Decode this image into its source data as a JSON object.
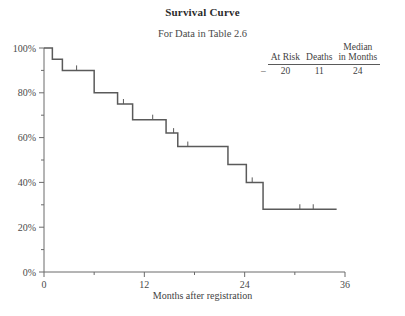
{
  "title": "Survival Curve",
  "subtitle": "For Data in Table 2.6",
  "summary": {
    "marker": "–",
    "headers": [
      "At Risk",
      "Deaths",
      "Median in Months"
    ],
    "header_at_risk": "At Risk",
    "header_deaths": "Deaths",
    "header_median_line1": "Median",
    "header_median_line2": "in Months",
    "values": [
      "20",
      "11",
      "24"
    ],
    "value_at_risk": "20",
    "value_deaths": "11",
    "value_median": "24"
  },
  "chart_data": {
    "type": "line",
    "title": "Survival Curve",
    "subtitle": "For Data in Table 2.6",
    "xlabel": "Months after registration",
    "ylabel": "",
    "xlim": [
      0,
      36
    ],
    "ylim": [
      0,
      100
    ],
    "grid": false,
    "legend": "none",
    "xticks": [
      0,
      12,
      24,
      36
    ],
    "xtick_labels": [
      "0",
      "12",
      "24",
      "36"
    ],
    "xminor_ticks": [
      6,
      18,
      30
    ],
    "yticks": [
      0,
      20,
      40,
      60,
      80,
      100
    ],
    "ytick_labels": [
      "0%",
      "20%",
      "40%",
      "60%",
      "80%",
      "100%"
    ],
    "yminor_ticks": [
      10,
      30,
      50,
      70,
      90
    ],
    "curve_style": "kaplan-meier-step",
    "n_at_risk": 20,
    "n_deaths": 11,
    "median_months": 24,
    "steps": [
      {
        "time": 0.0,
        "survival": 100
      },
      {
        "time": 1.0,
        "survival": 95
      },
      {
        "time": 2.2,
        "survival": 90
      },
      {
        "time": 6.0,
        "survival": 80
      },
      {
        "time": 8.8,
        "survival": 75
      },
      {
        "time": 10.6,
        "survival": 68
      },
      {
        "time": 14.6,
        "survival": 62
      },
      {
        "time": 16.0,
        "survival": 56
      },
      {
        "time": 22.0,
        "survival": 48
      },
      {
        "time": 24.2,
        "survival": 40
      },
      {
        "time": 26.2,
        "survival": 28
      },
      {
        "time": 35.0,
        "survival": 28
      }
    ],
    "censor_marks": [
      {
        "time": 3.9,
        "survival": 90
      },
      {
        "time": 9.5,
        "survival": 75
      },
      {
        "time": 13.0,
        "survival": 68
      },
      {
        "time": 15.5,
        "survival": 62
      },
      {
        "time": 17.2,
        "survival": 56
      },
      {
        "time": 24.9,
        "survival": 40
      },
      {
        "time": 30.6,
        "survival": 28
      },
      {
        "time": 32.2,
        "survival": 28
      }
    ]
  },
  "colors": {
    "curve": "#5a5a5a",
    "axis": "#6b6b6b",
    "text": "#3f3f3f"
  }
}
